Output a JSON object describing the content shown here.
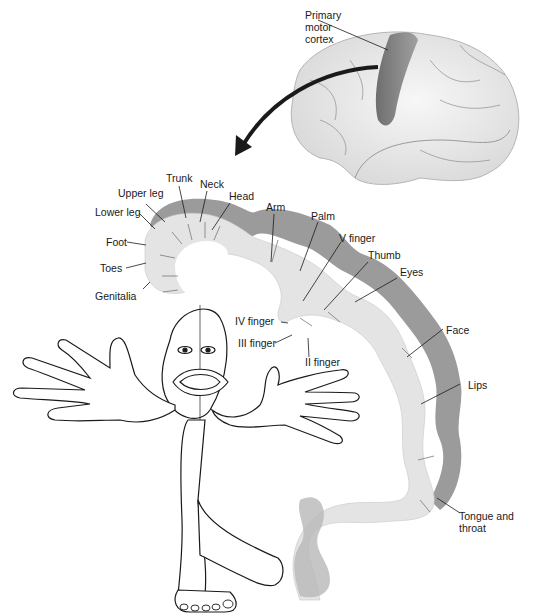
{
  "figure": {
    "brain_label": "Primary\nmotor\ncortex",
    "brain_label_lines": [
      "Primary",
      "motor",
      "cortex"
    ]
  },
  "labels": {
    "upper_leg": "Upper leg",
    "trunk": "Trunk",
    "neck": "Neck",
    "head": "Head",
    "lower_leg": "Lower leg",
    "foot": "Foot",
    "toes": "Toes",
    "genitalia": "Genitalia",
    "arm": "Arm",
    "palm": "Palm",
    "v_finger": "V finger",
    "thumb": "Thumb",
    "eyes": "Eyes",
    "iv_finger": "IV finger",
    "iii_finger": "III finger",
    "ii_finger": "II finger",
    "face": "Face",
    "lips": "Lips",
    "tongue_line1": "Tongue and",
    "tongue_line2": "throat"
  },
  "colors": {
    "cortex_light": "#e6e6e6",
    "cortex_dark": "#7a7a7a",
    "brain_fill": "#ececec",
    "motor_strip": "#8a8a8a",
    "ink": "#1a1a1a"
  }
}
